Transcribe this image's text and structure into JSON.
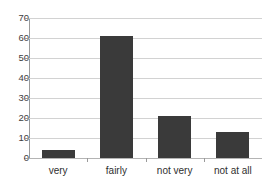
{
  "chart_data": {
    "type": "bar",
    "title": "",
    "title_note": "cropped at top edge of screenshot, illegible",
    "xlabel": "",
    "ylabel": "",
    "categories": [
      "very",
      "fairly",
      "not very",
      "not at all"
    ],
    "values": [
      4,
      61,
      21,
      13
    ],
    "ylim": [
      0,
      70
    ],
    "yticks": [
      0,
      10,
      20,
      30,
      40,
      50,
      60,
      70
    ],
    "ytick_labels": [
      "0",
      "10",
      "20",
      "30",
      "40",
      "50",
      "60",
      "70"
    ],
    "grid": "horizontal",
    "legend": "none",
    "bar_color": "#3a3a3a",
    "gridline_color": "#d2d2d2",
    "axis_color": "#9a9a9a",
    "background_color": "#ffffff"
  }
}
